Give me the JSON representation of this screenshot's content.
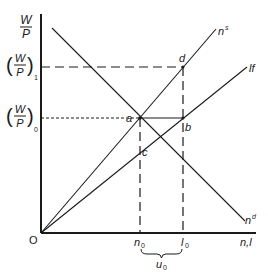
{
  "diagram": {
    "y_axis_label": {
      "num": "W",
      "den": "P"
    },
    "x_axis_label": "n,l",
    "origin_label": "O",
    "wage_levels": [
      {
        "name": "(W/P)1",
        "num": "W",
        "den": "P",
        "sub": "1",
        "style": "dashed"
      },
      {
        "name": "(W/P)0",
        "num": "W",
        "den": "P",
        "sub": "0",
        "style": "dotted"
      }
    ],
    "curves": {
      "supply": {
        "label": "n",
        "sup": "s"
      },
      "labor_force": {
        "label": "lf"
      },
      "demand": {
        "label": "n",
        "sup": "d"
      }
    },
    "points": {
      "a": "a",
      "b": "b",
      "c": "c",
      "d": "d"
    },
    "x_ticks": [
      {
        "label": "n",
        "sub": "0"
      },
      {
        "label": "l",
        "sub": "0"
      }
    ],
    "brace_label": {
      "label": "u",
      "sub": "0"
    }
  }
}
